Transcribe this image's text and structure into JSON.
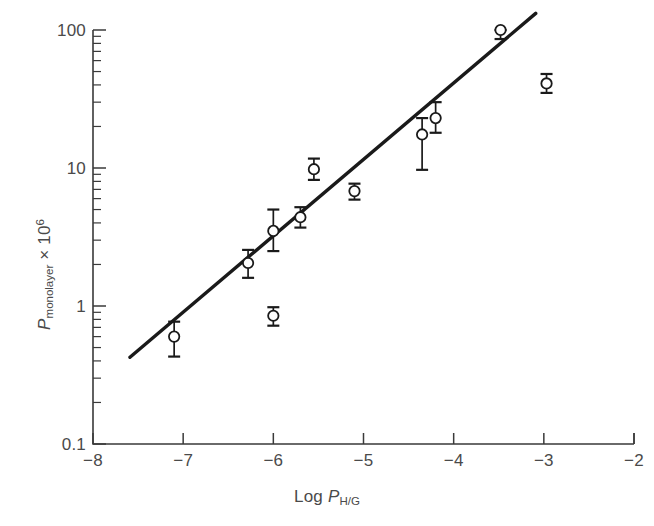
{
  "figure": {
    "name": "monolayer-permeability-scatter",
    "background": "#ffffff",
    "ink_color": "#1a1a1a",
    "label_color": "#4a4a4a"
  },
  "axes": {
    "x": {
      "title_prefix": "Log ",
      "title_symbol": "P",
      "title_subscript": "H/G",
      "min": -8,
      "max": -2,
      "scale": "linear",
      "ticks": [
        -8,
        -7,
        -6,
        -5,
        -4,
        -3,
        -2
      ],
      "tick_labels": [
        "−8",
        "−7",
        "−6",
        "−5",
        "−4",
        "−3",
        "−2"
      ],
      "tick_direction": "up"
    },
    "y": {
      "title_symbol": "P",
      "title_subscript": "monolayer",
      "title_multiplier": " × 10",
      "title_exponent": "6",
      "min": 0.1,
      "max": 100,
      "scale": "log",
      "ticks": [
        0.1,
        1,
        10,
        100
      ],
      "tick_labels": [
        "0.1",
        "1",
        "10",
        "100"
      ],
      "minor_ticks": [
        0.2,
        0.3,
        0.4,
        0.5,
        0.6,
        0.7,
        0.8,
        0.9,
        2,
        3,
        4,
        5,
        6,
        7,
        8,
        9,
        20,
        30,
        40,
        50,
        60,
        70,
        80,
        90
      ],
      "tick_direction": "right"
    }
  },
  "chart_data": {
    "type": "scatter",
    "title": "",
    "xlabel": "Log P_H/G",
    "ylabel": "P_monolayer × 10^6",
    "xlim": [
      -8,
      -2
    ],
    "ylim": [
      0.1,
      100
    ],
    "yscale": "log",
    "grid": false,
    "legend": "none",
    "marker_style": "open-circle",
    "x": [
      -7.1,
      -6.28,
      -6.0,
      -6.0,
      -5.7,
      -5.55,
      -5.1,
      -4.35,
      -4.2,
      -3.48,
      -2.97
    ],
    "y": [
      0.6,
      2.05,
      3.5,
      0.85,
      4.4,
      9.8,
      6.8,
      17.5,
      23.0,
      100.0,
      41.0
    ],
    "y_err_low": [
      0.17,
      0.45,
      1.0,
      0.13,
      0.7,
      1.6,
      0.9,
      7.8,
      5.0,
      14.0,
      6.0
    ],
    "y_err_high": [
      0.17,
      0.5,
      1.5,
      0.13,
      0.8,
      1.9,
      0.9,
      5.5,
      7.0,
      16.0,
      7.0
    ],
    "points": [
      {
        "label": "p1",
        "x": -7.1,
        "y": 0.6,
        "err_low": 0.17,
        "err_high": 0.17
      },
      {
        "label": "p2",
        "x": -6.28,
        "y": 2.05,
        "err_low": 0.45,
        "err_high": 0.5
      },
      {
        "label": "p3",
        "x": -6.0,
        "y": 3.5,
        "err_low": 1.0,
        "err_high": 1.5
      },
      {
        "label": "p4",
        "x": -6.0,
        "y": 0.85,
        "err_low": 0.13,
        "err_high": 0.13
      },
      {
        "label": "p5",
        "x": -5.7,
        "y": 4.4,
        "err_low": 0.7,
        "err_high": 0.8
      },
      {
        "label": "p6",
        "x": -5.55,
        "y": 9.8,
        "err_low": 1.6,
        "err_high": 1.9
      },
      {
        "label": "p7",
        "x": -5.1,
        "y": 6.8,
        "err_low": 0.9,
        "err_high": 0.9
      },
      {
        "label": "p8",
        "x": -4.35,
        "y": 17.5,
        "err_low": 7.8,
        "err_high": 5.5
      },
      {
        "label": "p9",
        "x": -4.2,
        "y": 23.0,
        "err_low": 5.0,
        "err_high": 7.0
      },
      {
        "label": "p10",
        "x": -3.48,
        "y": 100.0,
        "err_low": 14.0,
        "err_high": 16.0
      },
      {
        "label": "p11",
        "x": -2.97,
        "y": 41.0,
        "err_low": 6.0,
        "err_high": 7.0
      }
    ],
    "fit_line": {
      "style": "solid",
      "x_start": -7.59,
      "y_start": 0.425,
      "x_end": -3.09,
      "y_end": 132.0
    }
  }
}
